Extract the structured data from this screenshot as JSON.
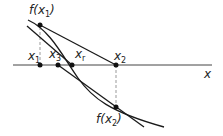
{
  "diagram": {
    "labels": {
      "f_x1": "f(x",
      "f_x1_sub": "1",
      "f_x2": "f(x",
      "f_x2_sub": "2",
      "x1": "x",
      "x1_sub": "1",
      "x3": "x",
      "x3_sub": "3",
      "xr": "x",
      "xr_sub": "r",
      "x2": "x",
      "x2_sub": "2",
      "axis": "x"
    },
    "close_paren": ")",
    "colors": {
      "line": "#1a1a1a",
      "dashed": "#888888"
    }
  }
}
